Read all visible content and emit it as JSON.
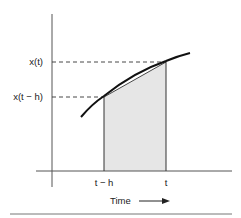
{
  "diagram": {
    "y_labels": {
      "upper": "x(t)",
      "lower": "x(t − h)"
    },
    "x_labels": {
      "left": "t − h",
      "right": "t"
    },
    "axis_caption": "Time",
    "colors": {
      "line": "#222222",
      "shade": "#e6e6e6",
      "axis": "#555555"
    }
  }
}
